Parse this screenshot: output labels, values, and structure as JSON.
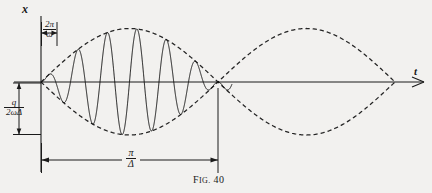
{
  "figure": {
    "caption_prefix": "F",
    "caption_rest": "IG.",
    "caption_number": "40",
    "caption_full": "Fig. 40"
  },
  "axes": {
    "vertical_label": "x",
    "horizontal_label": "t",
    "origin_x": 41,
    "baseline_y": 82,
    "axis_top_y": 16,
    "axis_right_x": 424
  },
  "annotations": {
    "period_carrier": {
      "numerator": "2π",
      "denominator": "ω",
      "meaning": "carrier-period-2pi-over-omega"
    },
    "amplitude": {
      "numerator": "q",
      "denominator": "2ωΔ",
      "meaning": "amplitude-q-over-2-omega-delta"
    },
    "beat_length": {
      "numerator": "π",
      "denominator": "Δ",
      "meaning": "beat-length-pi-over-delta"
    }
  },
  "colors": {
    "ink": "#1a1a1a",
    "background": "#f2f1ef",
    "envelope": "#2a2a2a",
    "carrier": "#1a1a1a"
  },
  "chart_data": {
    "type": "line",
    "xlabel": "t",
    "ylabel": "x",
    "grid": false,
    "legend": false,
    "series": [
      {
        "name": "carrier-oscillation",
        "style": "solid",
        "x_range": [
          0,
          3.14159
        ],
        "carrier_cycles": 12,
        "drawn_from_x": 41,
        "drawn_to_x": 232
      },
      {
        "name": "envelope-upper",
        "style": "dashed",
        "expression": "+A |sin(Δt)|",
        "x_range": [
          0,
          6.28318
        ]
      },
      {
        "name": "envelope-lower",
        "style": "dashed",
        "expression": "-A |sin(Δt)|",
        "x_range": [
          0,
          6.28318
        ]
      }
    ],
    "annotations": [
      {
        "label": "2π/ω",
        "type": "horizontal-measure",
        "from_x": 41,
        "to_x": 57,
        "at_y": 33
      },
      {
        "label": "q/(2ωΔ)",
        "type": "vertical-measure",
        "from_y": 82,
        "to_y": 135,
        "at_x": 27
      },
      {
        "label": "π/Δ",
        "type": "horizontal-measure",
        "from_x": 41,
        "to_x": 218,
        "at_y": 160
      }
    ],
    "nodes_x": [
      41,
      218,
      395
    ],
    "ylim": [
      -1.15,
      1.15
    ]
  }
}
